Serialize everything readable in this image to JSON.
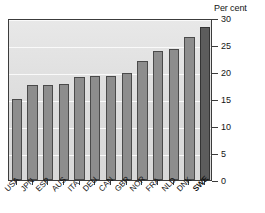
{
  "chart_data": {
    "type": "bar",
    "title": "",
    "subtitle": "",
    "xlabel": "",
    "ylabel": "Per cent",
    "units_label": "Per cent",
    "categories": [
      "USA",
      "JPN",
      "ESP",
      "AUS",
      "ITA",
      "DEU",
      "CAN",
      "GBR",
      "NOR",
      "FRA",
      "NLD",
      "DNK",
      "SWE"
    ],
    "values": [
      15.0,
      17.6,
      17.6,
      17.8,
      19.0,
      19.2,
      19.3,
      19.9,
      22.1,
      23.8,
      24.3,
      26.5,
      28.3
    ],
    "ylim": [
      0,
      30
    ],
    "yticks": [
      0,
      5,
      10,
      15,
      20,
      25,
      30
    ],
    "ytick_labels": [
      "0",
      "5",
      "10",
      "15",
      "20",
      "25",
      "30"
    ],
    "grid": true,
    "grid_axis": "y",
    "legend": false,
    "legend_position": "none",
    "highlight_category": "SWE",
    "bar_color": "#8d8d8d",
    "bar_edge_color": "#4a4a4a",
    "highlight_bar_color": "#5c5c5c",
    "highlight_bar_edge_color": "#333333",
    "plot_background_color": "#e2e2e2",
    "gridline_color": "#fbfbfb",
    "axis_color": "#3c3c3c",
    "text_color": "#141414",
    "y_axis_position": "right",
    "xtick_label_rotation": -45
  }
}
